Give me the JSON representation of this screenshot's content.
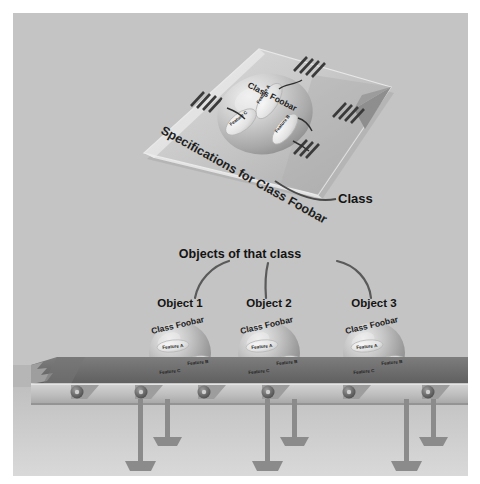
{
  "illustration": {
    "title_concept": "Class and objects of that class on an assembly line",
    "spec_sheet": {
      "name": "specification-sheet",
      "title_text": "Specifications for Class Foobar",
      "sphere_label": "Class Foobar",
      "features": [
        "Feature A",
        "Feature B",
        "Feature C"
      ],
      "callout_label": "Class",
      "text_line_groups": 4
    },
    "middle_callout": {
      "label": "Objects of that class",
      "arrow_count": 3
    },
    "objects": [
      {
        "name": "object-1",
        "label": "Object 1",
        "sphere_label": "Class Foobar",
        "features": [
          "Feature A",
          "Feature B",
          "Feature C"
        ]
      },
      {
        "name": "object-2",
        "label": "Object 2",
        "sphere_label": "Class Foobar",
        "features": [
          "Feature A",
          "Feature B",
          "Feature C"
        ]
      },
      {
        "name": "object-3",
        "label": "Object 3",
        "sphere_label": "Class Foobar",
        "features": [
          "Feature A",
          "Feature B",
          "Feature C"
        ]
      }
    ],
    "conveyor": {
      "name": "conveyor-belt",
      "roller_count": 6,
      "leg_pair_count": 3
    },
    "colors": {
      "background_top": "#c2c2c2",
      "background_bottom": "#d5d5d5",
      "paper_light": "#d8d8d8",
      "paper_mid": "#b9b9b9",
      "paper_shadow": "#9a9a9a",
      "ink": "#2b2b2b",
      "sphere_light": "#e4e4e4",
      "sphere_mid": "#b5b5b5",
      "sphere_dark": "#8d8d8d",
      "belt_dark": "#6e6e6e",
      "belt_frame": "#c9c9c9",
      "metal": "#8a8a8a"
    }
  }
}
